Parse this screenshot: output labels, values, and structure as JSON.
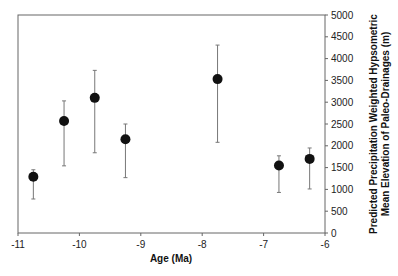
{
  "chart_data": {
    "type": "scatter",
    "title": "",
    "xlabel": "Age (Ma)",
    "ylabel": "Predicted Precipitation Weighted Hypsometric Mean Elevation of Paleo-Drainages (m)",
    "ylabel_lines": [
      "Predicted Precipitation Weighted Hypsometric",
      "Mean Elevation of Paleo-Drainages (m)"
    ],
    "xlim": [
      -11,
      -6
    ],
    "ylim": [
      0,
      5000
    ],
    "x_ticks": [
      -11,
      -10,
      -9,
      -8,
      -7,
      -6
    ],
    "y_ticks": [
      0,
      500,
      1000,
      1500,
      2000,
      2500,
      3000,
      3500,
      4000,
      4500,
      5000
    ],
    "y_axis_position": "right",
    "grid": false,
    "legend": null,
    "series": [
      {
        "name": "Paleo-drainage elevation",
        "marker": "circle",
        "color": "#111111",
        "points": [
          {
            "x": -10.75,
            "y": 1290,
            "y_low": 780,
            "y_high": 1450
          },
          {
            "x": -10.25,
            "y": 2570,
            "y_low": 1540,
            "y_high": 3030
          },
          {
            "x": -9.75,
            "y": 3100,
            "y_low": 1840,
            "y_high": 3730
          },
          {
            "x": -9.25,
            "y": 2150,
            "y_low": 1270,
            "y_high": 2500
          },
          {
            "x": -7.75,
            "y": 3530,
            "y_low": 2080,
            "y_high": 4310
          },
          {
            "x": -6.75,
            "y": 1550,
            "y_low": 930,
            "y_high": 1770
          },
          {
            "x": -6.25,
            "y": 1700,
            "y_low": 1010,
            "y_high": 1950
          }
        ]
      }
    ]
  },
  "colors": {
    "axis": "#666666",
    "errorbar": "#777777",
    "marker": "#111111",
    "background": "#ffffff"
  }
}
